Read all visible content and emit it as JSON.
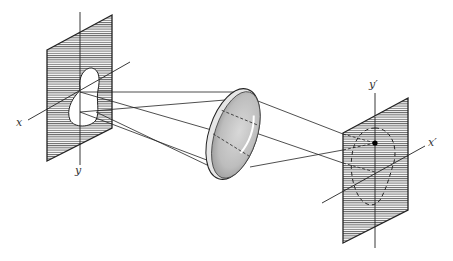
{
  "figure": {
    "colors": {
      "line": "#222222",
      "hatch": "#555555",
      "lens_fill": "#bdbdbd",
      "background": "#ffffff"
    }
  },
  "object_plane": {
    "axis_x_label": "x",
    "axis_y_label": "y"
  },
  "image_plane": {
    "axis_x_label": "x′",
    "axis_y_label": "y′"
  },
  "lens": {
    "name": "lens"
  }
}
